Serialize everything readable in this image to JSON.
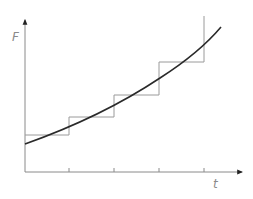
{
  "diagram": {
    "type": "step-approximation-of-curve",
    "axes": {
      "y_label": "F",
      "x_label": "t",
      "tick_count": 4
    },
    "colors": {
      "axis": "#8a8a8a",
      "step": "#9a9a9a",
      "curve": "#2a2a2a",
      "label": "#8a8a8a"
    },
    "step_function": {
      "description": "piecewise-constant approximation with 4 steps, final vertical rise",
      "levels": [
        1,
        2,
        3,
        4
      ],
      "intervals": 4
    },
    "curve": {
      "description": "smooth increasing convex curve (exponential-like)"
    }
  }
}
